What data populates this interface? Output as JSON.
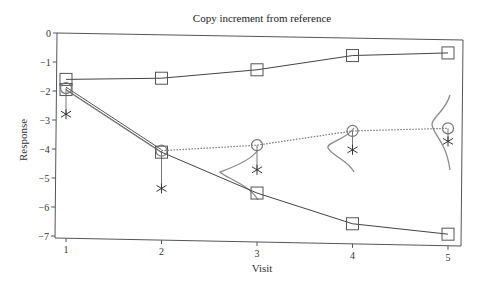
{
  "chart_data": {
    "type": "line",
    "title": "Copy increment from reference",
    "xlabel": "Visit",
    "ylabel": "Response",
    "x": [
      1,
      2,
      3,
      4,
      5
    ],
    "x_ticks": [
      "1",
      "2",
      "3",
      "4",
      "5"
    ],
    "y_ticks": [
      "0",
      "−1",
      "−2",
      "−3",
      "−4",
      "−5",
      "−6",
      "−7"
    ],
    "ylim": [
      -7,
      0
    ],
    "xlim": [
      1,
      5
    ],
    "grid": false,
    "legend": "none",
    "series": [
      {
        "name": "Reference arm mean",
        "marker": "square",
        "line": "solid",
        "values": [
          -1.6,
          -1.5,
          -1.15,
          -0.6,
          -0.45
        ]
      },
      {
        "name": "Active arm mean",
        "marker": "square",
        "line": "solid",
        "values": [
          -1.95,
          -4.05,
          -5.4,
          -6.4,
          -6.7
        ]
      },
      {
        "name": "Copy increment imputed mean",
        "marker": "circle",
        "line": "dotted",
        "values": [
          -1.9,
          -4.0,
          -3.75,
          -3.2,
          -3.05
        ]
      },
      {
        "name": "Observed individual",
        "marker": "asterisk",
        "line": "none",
        "values": [
          -2.8,
          -5.3,
          -4.6,
          -3.85,
          -3.5
        ]
      }
    ],
    "annotations": [
      "Conditional distribution curves at visits 3, 4, 5"
    ]
  }
}
